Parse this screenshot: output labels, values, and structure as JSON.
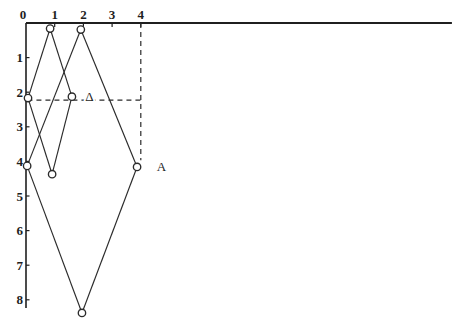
{
  "figure": {
    "width": 454,
    "height": 336,
    "background": "#ffffff",
    "ink_color": "#2b2b2b",
    "axis_color": "#1f1f1f",
    "origin": {
      "x": 26,
      "y": 23
    },
    "scale": {
      "x": 28.7,
      "y": 34.6
    }
  },
  "chart_data": {
    "type": "line",
    "title": "",
    "xlabel": "",
    "ylabel": "",
    "axis": {
      "x": {
        "position": "top",
        "tick_values": [
          0,
          1,
          2,
          3,
          4
        ],
        "tick_labels": [
          "0",
          "1",
          "2",
          "3",
          "4"
        ],
        "line_extends_to_units": 14.84
      },
      "y": {
        "position": "left",
        "direction": "down",
        "tick_values": [
          1,
          2,
          3,
          4,
          5,
          6,
          7,
          8
        ],
        "tick_labels": [
          "1",
          "2",
          "3",
          "4",
          "5",
          "6",
          "7",
          "8"
        ],
        "line_extends_to_units": 8.24
      }
    },
    "points": [
      {
        "id": "p1",
        "x": 0.84,
        "y": 0.16
      },
      {
        "id": "p2",
        "x": 1.91,
        "y": 0.19
      },
      {
        "id": "p3",
        "x": 0.07,
        "y": 2.17
      },
      {
        "id": "p4",
        "x": 1.6,
        "y": 2.13
      },
      {
        "id": "p5",
        "x": 0.04,
        "y": 4.13
      },
      {
        "id": "p6",
        "x": 0.91,
        "y": 4.37
      },
      {
        "id": "p7",
        "x": 3.87,
        "y": 4.16
      },
      {
        "id": "p8",
        "x": 1.95,
        "y": 8.38
      }
    ],
    "segments": [
      [
        "p3",
        "p1"
      ],
      [
        "p1",
        "p4"
      ],
      [
        "p2",
        "p5"
      ],
      [
        "p2",
        "p7"
      ],
      [
        "p3",
        "p6"
      ],
      [
        "p4",
        "p6"
      ],
      [
        "p5",
        "p8"
      ],
      [
        "p7",
        "p8"
      ]
    ],
    "dashed_guides": [
      {
        "name": "horizontal-guide-y2",
        "from": {
          "x": 0.05,
          "y": 2.23
        },
        "to": {
          "x": 4.0,
          "y": 2.23
        }
      },
      {
        "name": "vertical-guide-x4",
        "from": {
          "x": 4.0,
          "y": 0.0
        },
        "to": {
          "x": 4.0,
          "y": 3.97
        }
      }
    ],
    "annotations": [
      {
        "name": "delta-point-label",
        "text": "Δ",
        "x": 2.21,
        "y": 2.12,
        "halo": true
      },
      {
        "name": "a-point-label",
        "text": "A",
        "x": 4.72,
        "y": 4.14,
        "halo": false
      }
    ]
  }
}
